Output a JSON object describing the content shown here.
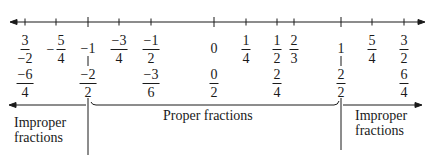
{
  "diagram": {
    "type": "number-line",
    "axis": {
      "min": -1.6,
      "max": 1.65,
      "arrows": "both"
    },
    "top_row": [
      {
        "value": -1.5,
        "x": 25,
        "kind": "fraction",
        "sign": "",
        "num": "3",
        "den": "−2"
      },
      {
        "value": -1.25,
        "x": 56,
        "kind": "fraction",
        "sign": "−",
        "num": "5",
        "den": "4"
      },
      {
        "value": -1,
        "x": 88,
        "kind": "whole",
        "text": "−1"
      },
      {
        "value": -0.75,
        "x": 119,
        "kind": "fraction",
        "sign": "",
        "num": "−3",
        "den": "4"
      },
      {
        "value": -0.5,
        "x": 151,
        "kind": "fraction",
        "sign": "",
        "num": "−1",
        "den": "2"
      },
      {
        "value": 0,
        "x": 214,
        "kind": "whole",
        "text": "0"
      },
      {
        "value": 0.25,
        "x": 246,
        "kind": "fraction",
        "sign": "",
        "num": "1",
        "den": "4"
      },
      {
        "value": 0.5,
        "x": 277,
        "kind": "fraction",
        "sign": "",
        "num": "1",
        "den": "2"
      },
      {
        "value": 0.667,
        "x": 294,
        "kind": "fraction",
        "sign": "",
        "num": "2",
        "den": "3"
      },
      {
        "value": 1,
        "x": 341,
        "kind": "whole",
        "text": "1"
      },
      {
        "value": 1.25,
        "x": 372,
        "kind": "fraction",
        "sign": "",
        "num": "5",
        "den": "4"
      },
      {
        "value": 1.5,
        "x": 404,
        "kind": "fraction",
        "sign": "",
        "num": "3",
        "den": "2"
      }
    ],
    "bottom_row": [
      {
        "value": -1.5,
        "x": 25,
        "num": "−6",
        "den": "4"
      },
      {
        "value": -1,
        "x": 88,
        "num": "−2",
        "den": "2"
      },
      {
        "value": -0.5,
        "x": 151,
        "num": "−3",
        "den": "6"
      },
      {
        "value": 0,
        "x": 214,
        "num": "0",
        "den": "2"
      },
      {
        "value": 0.5,
        "x": 277,
        "num": "2",
        "den": "4"
      },
      {
        "value": 1,
        "x": 341,
        "num": "2",
        "den": "2"
      },
      {
        "value": 1.5,
        "x": 404,
        "num": "6",
        "den": "4"
      }
    ],
    "regions": {
      "left": {
        "line1": "Improper",
        "line2": "fractions"
      },
      "middle": {
        "text": "Proper fractions"
      },
      "right": {
        "line1": "Improper",
        "line2": "fractions"
      }
    }
  }
}
